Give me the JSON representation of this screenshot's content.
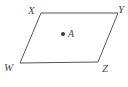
{
  "figure": {
    "type": "geometry-diagram",
    "shape": "parallelogram",
    "background_color": "#ffffff",
    "stroke_color": "#555555",
    "stroke_width": 1,
    "label_color": "#4a4a4a",
    "vertices": [
      {
        "name": "X",
        "label": "X",
        "x": 41,
        "y": 13,
        "label_x": 28,
        "label_y": 5
      },
      {
        "name": "Y",
        "label": "Y",
        "x": 118,
        "y": 13,
        "label_x": 118,
        "label_y": 4
      },
      {
        "name": "Z",
        "label": "Z",
        "x": 98,
        "y": 62,
        "label_x": 102,
        "label_y": 63
      },
      {
        "name": "W",
        "label": "W",
        "x": 20,
        "y": 63,
        "label_x": 4,
        "label_y": 62
      }
    ],
    "outline_points": "41,13 118,13 98,62 20,63",
    "interior_point": {
      "name": "A",
      "label": "A",
      "x": 63,
      "y": 34,
      "radius": 2,
      "fill": "#3a3a3a",
      "label_x": 68,
      "label_y": 29
    }
  }
}
